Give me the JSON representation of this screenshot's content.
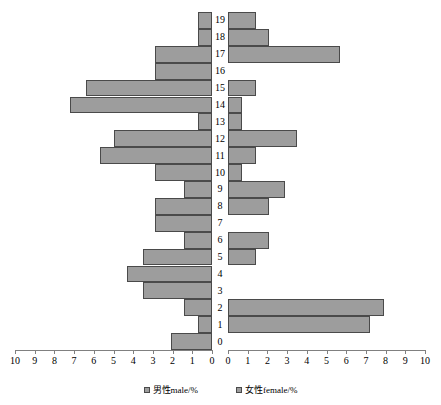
{
  "chart_data": {
    "type": "bar",
    "subtype": "population-pyramid",
    "title": "",
    "xlabel": "",
    "ylabel": "",
    "orientation": "horizontal",
    "categories": [
      "0",
      "1",
      "2",
      "3",
      "4",
      "5",
      "6",
      "7",
      "8",
      "9",
      "10",
      "11",
      "12",
      "13",
      "14",
      "15",
      "16",
      "17",
      "18",
      "19"
    ],
    "category_order": "bottom-to-top",
    "xlim_left": [
      10,
      0
    ],
    "xlim_right": [
      0,
      10
    ],
    "left_axis_ticks": [
      "10",
      "9",
      "8",
      "7",
      "6",
      "5",
      "4",
      "3",
      "2",
      "1",
      "0"
    ],
    "right_axis_ticks": [
      "0",
      "1",
      "2",
      "3",
      "4",
      "5",
      "6",
      "7",
      "8",
      "9",
      "10"
    ],
    "grid": false,
    "legend_position": "bottom",
    "series": [
      {
        "name": "男性male/%",
        "side": "left",
        "color": "#9d9d9d",
        "values": [
          2.1,
          0.7,
          1.4,
          3.5,
          4.3,
          3.5,
          1.4,
          2.9,
          2.9,
          1.4,
          2.9,
          5.7,
          5.0,
          0.7,
          7.2,
          6.4,
          2.9,
          2.9,
          0.7,
          0.7
        ]
      },
      {
        "name": "女性female/%",
        "side": "right",
        "color": "#9d9d9d",
        "values": [
          0.0,
          7.2,
          7.9,
          0.0,
          0.0,
          1.4,
          2.1,
          0.0,
          2.1,
          2.9,
          0.7,
          1.4,
          3.5,
          0.7,
          0.7,
          1.4,
          0.0,
          5.7,
          2.1,
          1.4
        ]
      }
    ]
  },
  "legend": {
    "items": [
      {
        "label": "男性male/%"
      },
      {
        "label": "女性female/%"
      }
    ]
  }
}
